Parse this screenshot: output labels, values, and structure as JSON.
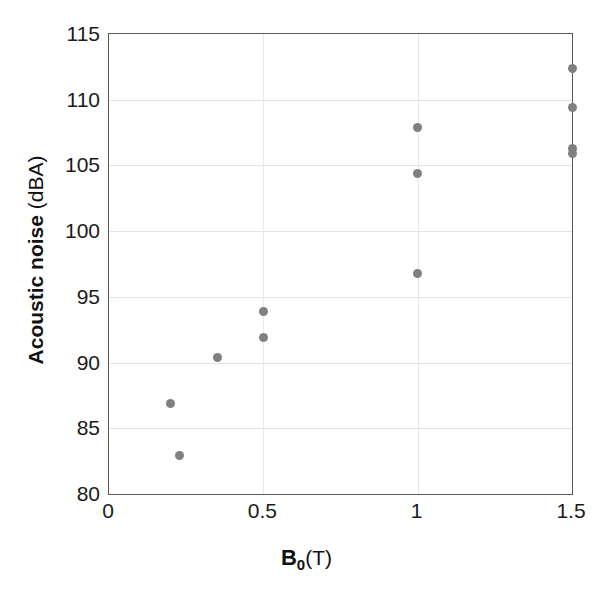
{
  "chart_data": {
    "type": "scatter",
    "title": "",
    "xlabel": "B0 (T)",
    "ylabel": "Acoustic noise (dBA)",
    "xlabel_parts": {
      "symbol": "B",
      "subscript": "0",
      "unit": "(T)"
    },
    "ylabel_parts": {
      "main": "Acoustic noise",
      "unit": "(dBA)"
    },
    "xlim": [
      0,
      1.5
    ],
    "ylim": [
      80,
      115
    ],
    "xticks": [
      0,
      0.5,
      1,
      1.5
    ],
    "xtick_labels": [
      "0",
      "0.5",
      "1",
      "1.5"
    ],
    "yticks": [
      80,
      85,
      90,
      95,
      100,
      105,
      110,
      115
    ],
    "ytick_labels": [
      "80",
      "85",
      "90",
      "95",
      "100",
      "105",
      "110",
      "115"
    ],
    "grid": true,
    "grid_axis": "both",
    "legend": false,
    "marker_color": "#808080",
    "marker_shape": "circle",
    "axis_color": "#5a5a5a",
    "grid_color": "#e3e3e3",
    "background": "#ffffff",
    "points": [
      {
        "x": 0.2,
        "y": 86.9
      },
      {
        "x": 0.23,
        "y": 82.9
      },
      {
        "x": 0.35,
        "y": 90.4
      },
      {
        "x": 0.5,
        "y": 93.9
      },
      {
        "x": 0.5,
        "y": 91.9
      },
      {
        "x": 1.0,
        "y": 107.9
      },
      {
        "x": 1.0,
        "y": 104.4
      },
      {
        "x": 1.0,
        "y": 96.8
      },
      {
        "x": 1.5,
        "y": 112.4
      },
      {
        "x": 1.5,
        "y": 109.4
      },
      {
        "x": 1.5,
        "y": 106.3
      },
      {
        "x": 1.5,
        "y": 105.9
      }
    ]
  }
}
